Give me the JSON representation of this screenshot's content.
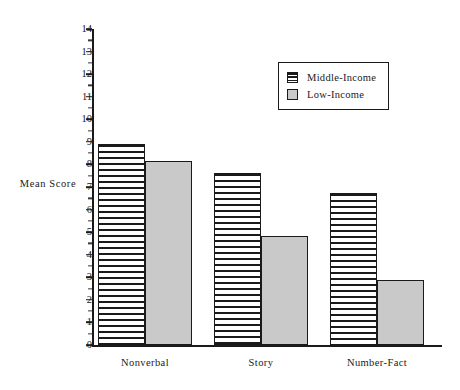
{
  "chart_data": {
    "type": "bar",
    "title": "",
    "subtitle": "",
    "xlabel": "",
    "ylabel": "Mean Score",
    "ylim": [
      0,
      14
    ],
    "ytick_step": 1,
    "yticks": [
      "0",
      "1",
      "2",
      "3",
      "4",
      "5",
      "6",
      "7",
      "8",
      "9",
      "10",
      "11",
      "12",
      "13",
      "14"
    ],
    "grid": false,
    "legend_position": "top-right",
    "categories": [
      "Nonverbal",
      "Story",
      "Number-Fact"
    ],
    "series": [
      {
        "name": "Middle-Income",
        "fill": "horizontal-hatch",
        "color": "#ffffff",
        "values": [
          8.9,
          7.6,
          6.75
        ]
      },
      {
        "name": "Low-Income",
        "fill": "solid-gray",
        "color": "#c9c9c9",
        "values": [
          8.15,
          4.85,
          2.9
        ]
      }
    ]
  },
  "axes": {
    "y_title": "Mean Score"
  },
  "legend": {
    "items": [
      {
        "label": "Middle-Income",
        "swatch": "hatched-swatch"
      },
      {
        "label": "Low-Income",
        "swatch": "gray-swatch"
      }
    ]
  },
  "colors": {
    "axis": "#1a1a1a",
    "hatch_line": "#1a1a1a",
    "solid_fill": "#c9c9c9",
    "background": "#ffffff"
  }
}
